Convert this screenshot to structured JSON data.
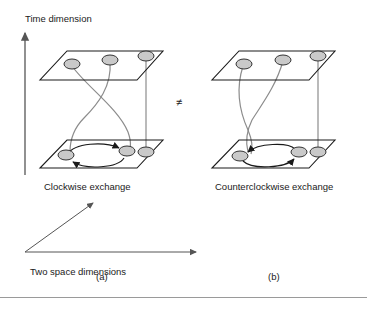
{
  "figure": {
    "caption_left": "(a)",
    "caption_right": "(b)",
    "relation_symbol": "≠",
    "axes": {
      "time_label": "Time dimension",
      "space_label": "Two space dimensions"
    },
    "panels": [
      {
        "id": "a",
        "label": "(a)",
        "title": "Clockwise exchange",
        "exchange_direction": "clockwise",
        "planes": 2,
        "particles_top": 3,
        "particles_bottom": 3,
        "worldlines": [
          "braided-curve-left",
          "braided-curve-middle",
          "straight-vertical-right"
        ]
      },
      {
        "id": "b",
        "label": "(b)",
        "title": "Counterclockwise exchange",
        "exchange_direction": "counterclockwise",
        "planes": 2,
        "particles_top": 3,
        "particles_bottom": 3,
        "worldlines": [
          "braided-curve-left",
          "braided-curve-middle",
          "straight-vertical-right"
        ]
      }
    ],
    "colors": {
      "particle_fill": "#c9c9c9",
      "particle_stroke": "#333333",
      "plane_stroke": "#1a1a1a",
      "worldline_stroke": "#8c8c8c",
      "arrow_fill": "#1a1a1a",
      "rule": "#9a9a9a"
    },
    "icons": {
      "time_axis": "up-arrow-icon",
      "space_axis_horizontal": "right-arrow-icon",
      "space_axis_diagonal": "diagonal-arrow-icon"
    }
  }
}
